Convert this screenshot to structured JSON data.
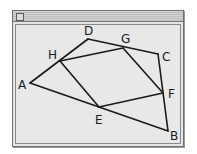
{
  "window": {
    "title": "",
    "close_box": "close-box-icon"
  },
  "diagram": {
    "stroke_color": "#1a1a1a",
    "points": {
      "A": {
        "label": "A",
        "x": 30,
        "y": 83,
        "lx": 18,
        "ly": 89
      },
      "B": {
        "label": "B",
        "x": 168,
        "y": 131,
        "lx": 170,
        "ly": 140
      },
      "C": {
        "label": "C",
        "x": 158,
        "y": 54,
        "lx": 162,
        "ly": 61
      },
      "D": {
        "label": "D",
        "x": 88,
        "y": 39,
        "lx": 84,
        "ly": 35
      },
      "E": {
        "label": "E",
        "x": 99,
        "y": 107,
        "lx": 95,
        "ly": 124
      },
      "F": {
        "label": "F",
        "x": 163,
        "y": 93,
        "lx": 168,
        "ly": 98
      },
      "G": {
        "label": "G",
        "x": 123,
        "y": 48,
        "lx": 121,
        "ly": 43
      },
      "H": {
        "label": "H",
        "x": 60,
        "y": 61,
        "lx": 48,
        "ly": 59
      }
    },
    "segments": [
      [
        "A",
        "D"
      ],
      [
        "D",
        "C"
      ],
      [
        "C",
        "B"
      ],
      [
        "B",
        "A"
      ],
      [
        "H",
        "G"
      ],
      [
        "G",
        "F"
      ],
      [
        "F",
        "E"
      ],
      [
        "E",
        "H"
      ]
    ],
    "quadrilaterals": {
      "outer": "ABCD",
      "inner": "EFGH"
    }
  }
}
